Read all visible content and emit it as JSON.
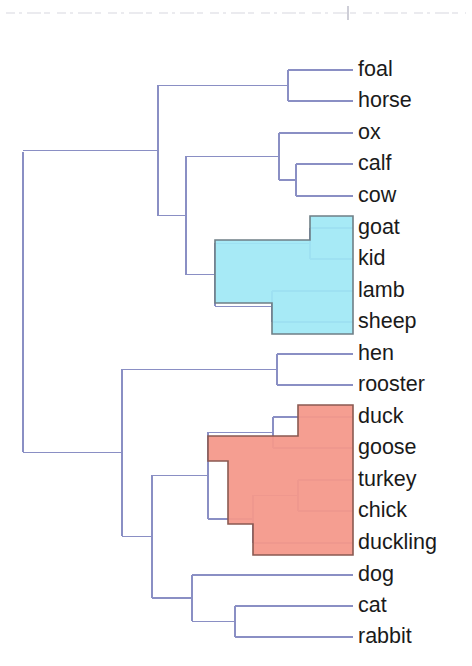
{
  "figure": {
    "kind": "dendrogram",
    "orientation": "horizontal-leaves-right",
    "background_color": "#ffffff",
    "line_color": "#8a8fc4",
    "label_color": "#1a1a1a"
  },
  "clusters": [
    {
      "name": "sheep-goat-cluster",
      "fill_color": "#9fe8f5",
      "stroke_color": "#6f7f86",
      "members": [
        "goat",
        "kid",
        "lamb",
        "sheep"
      ]
    },
    {
      "name": "poultry-cluster",
      "fill_color": "#f4998b",
      "stroke_color": "#8a5a52",
      "members": [
        "duck",
        "goose",
        "turkey",
        "chick",
        "duckling"
      ]
    }
  ],
  "chart_data": {
    "type": "dendrogram",
    "title": "",
    "xlabel": "",
    "ylabel": "",
    "leaf_order": [
      "foal",
      "horse",
      "ox",
      "calf",
      "cow",
      "goat",
      "kid",
      "lamb",
      "sheep",
      "hen",
      "rooster",
      "duck",
      "goose",
      "turkey",
      "chick",
      "duckling",
      "dog",
      "cat",
      "rabbit"
    ],
    "leaves": [
      {
        "label": "foal",
        "y": 70,
        "x_tip": 353
      },
      {
        "label": "horse",
        "y": 101,
        "x_tip": 353
      },
      {
        "label": "ox",
        "y": 133,
        "x_tip": 353
      },
      {
        "label": "calf",
        "y": 164,
        "x_tip": 353
      },
      {
        "label": "cow",
        "y": 196,
        "x_tip": 353
      },
      {
        "label": "goat",
        "y": 228,
        "x_tip": 353
      },
      {
        "label": "kid",
        "y": 259,
        "x_tip": 353
      },
      {
        "label": "lamb",
        "y": 291,
        "x_tip": 353
      },
      {
        "label": "sheep",
        "y": 322,
        "x_tip": 353
      },
      {
        "label": "hen",
        "y": 354,
        "x_tip": 353
      },
      {
        "label": "rooster",
        "y": 385,
        "x_tip": 353
      },
      {
        "label": "duck",
        "y": 417,
        "x_tip": 353
      },
      {
        "label": "goose",
        "y": 448,
        "x_tip": 353
      },
      {
        "label": "turkey",
        "y": 480,
        "x_tip": 353
      },
      {
        "label": "chick",
        "y": 511,
        "x_tip": 353
      },
      {
        "label": "duckling",
        "y": 543,
        "x_tip": 353
      },
      {
        "label": "dog",
        "y": 575,
        "x_tip": 353
      },
      {
        "label": "cat",
        "y": 606,
        "x_tip": 353
      },
      {
        "label": "rabbit",
        "y": 637,
        "x_tip": 353
      }
    ],
    "merges": [
      {
        "name": "foal-horse",
        "x": 288,
        "y_top": 70,
        "y_bot": 101
      },
      {
        "name": "calf-cow",
        "x": 296,
        "y_top": 164,
        "y_bot": 196
      },
      {
        "name": "ox-calfcow",
        "x": 279,
        "y_top": 133,
        "y_bot": 180
      },
      {
        "name": "goat-kid",
        "x": 310,
        "y_top": 228,
        "y_bot": 259
      },
      {
        "name": "lamb-sheep",
        "x": 272,
        "y_top": 291,
        "y_bot": 322
      },
      {
        "name": "goatkid-lambsheep",
        "x": 215,
        "y_top": 243,
        "y_bot": 306
      },
      {
        "name": "bovid-group",
        "x": 186,
        "y_top": 156,
        "y_bot": 275
      },
      {
        "name": "equid-bovid",
        "x": 158,
        "y_top": 85,
        "y_bot": 216
      },
      {
        "name": "hen-rooster",
        "x": 277,
        "y_top": 354,
        "y_bot": 385
      },
      {
        "name": "duck-goose",
        "x": 273,
        "y_top": 417,
        "y_bot": 448
      },
      {
        "name": "turkey-chick",
        "x": 298,
        "y_top": 480,
        "y_bot": 511
      },
      {
        "name": "turkeychick-duckling",
        "x": 253,
        "y_top": 495,
        "y_bot": 543
      },
      {
        "name": "duckgoose-rest",
        "x": 208,
        "y_top": 432,
        "y_bot": 519
      },
      {
        "name": "cat-rabbit",
        "x": 235,
        "y_top": 606,
        "y_bot": 637
      },
      {
        "name": "dog-catrabbit",
        "x": 192,
        "y_top": 575,
        "y_bot": 621
      },
      {
        "name": "poultry-pets",
        "x": 152,
        "y_top": 475,
        "y_bot": 598
      },
      {
        "name": "birds-mammals",
        "x": 122,
        "y_top": 369,
        "y_bot": 536
      },
      {
        "name": "root",
        "x": 23,
        "y_top": 152,
        "y_bot": 452
      }
    ]
  },
  "labels": {
    "rows": [
      "foal",
      "horse",
      "ox",
      "calf",
      "cow",
      "goat",
      "kid",
      "lamb",
      "sheep",
      "hen",
      "rooster",
      "duck",
      "goose",
      "turkey",
      "chick",
      "duckling",
      "dog",
      "cat",
      "rabbit"
    ]
  }
}
